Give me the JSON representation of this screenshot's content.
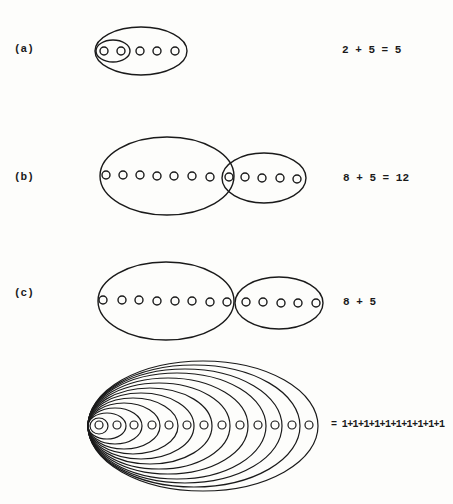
{
  "panels": [
    {
      "id": "a",
      "label": "(a)",
      "equation": "2 + 5 = 5"
    },
    {
      "id": "b",
      "label": "(b)",
      "equation": "8 + 5 = 12"
    },
    {
      "id": "c",
      "label": "(c)",
      "equation": "8 + 5"
    },
    {
      "id": "d",
      "label": "",
      "equation": "= 1+1+1+1+1+1+1+1+1+1"
    }
  ],
  "colors": {
    "ink": "#1a1a1a",
    "paper": "#fdfdfb"
  }
}
